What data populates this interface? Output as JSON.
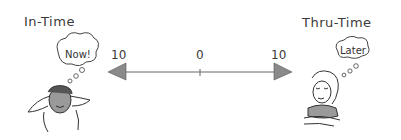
{
  "labels": {
    "left_title": "In-Time",
    "right_title": "Thru-Time",
    "left_thought": "Now!",
    "right_thought": "Later"
  },
  "scale": {
    "left_value": "10",
    "center_value": "0",
    "right_value": "10"
  },
  "colors": {
    "arrowhead": "#8a8a8a",
    "line": "#666666",
    "skin_shade": "#9a9a9a"
  }
}
